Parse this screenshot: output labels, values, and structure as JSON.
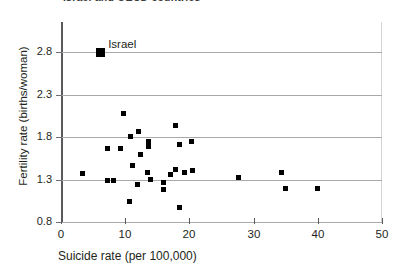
{
  "chart_data": {
    "type": "scatter",
    "title": "",
    "xlabel": "Suicide rate (per 100,000)",
    "ylabel": "Fertility rate (births/woman)",
    "xlim": [
      0,
      50
    ],
    "ylim": [
      0.8,
      2.8
    ],
    "xticks": [
      "0",
      "10",
      "20",
      "30",
      "40",
      "50"
    ],
    "yticks": [
      "0.8",
      "1.3",
      "1.8",
      "2.3",
      "2.8"
    ],
    "grid": "horizontal",
    "legend": "none",
    "annotations": [
      {
        "label": "Israel",
        "x": 6.1,
        "y": 2.79
      }
    ],
    "series": [
      {
        "name": "countries",
        "marker": "square",
        "color": "#000000",
        "points": [
          {
            "x": 6.1,
            "y": 2.79,
            "label": "Israel",
            "highlight": true
          },
          {
            "x": 3.3,
            "y": 1.37
          },
          {
            "x": 7.3,
            "y": 1.29
          },
          {
            "x": 7.2,
            "y": 1.67
          },
          {
            "x": 8.1,
            "y": 1.29
          },
          {
            "x": 9.2,
            "y": 1.67
          },
          {
            "x": 9.8,
            "y": 2.08
          },
          {
            "x": 10.9,
            "y": 1.81
          },
          {
            "x": 10.6,
            "y": 1.04
          },
          {
            "x": 11.1,
            "y": 1.47
          },
          {
            "x": 11.9,
            "y": 1.24
          },
          {
            "x": 12.0,
            "y": 1.87
          },
          {
            "x": 12.4,
            "y": 1.6
          },
          {
            "x": 13.5,
            "y": 1.38
          },
          {
            "x": 13.6,
            "y": 1.69
          },
          {
            "x": 13.7,
            "y": 1.75
          },
          {
            "x": 13.9,
            "y": 1.3
          },
          {
            "x": 15.9,
            "y": 1.18
          },
          {
            "x": 16.0,
            "y": 1.27
          },
          {
            "x": 17.1,
            "y": 1.36
          },
          {
            "x": 17.8,
            "y": 1.42
          },
          {
            "x": 17.8,
            "y": 1.93
          },
          {
            "x": 18.5,
            "y": 1.71
          },
          {
            "x": 19.3,
            "y": 1.38
          },
          {
            "x": 18.4,
            "y": 0.97
          },
          {
            "x": 20.4,
            "y": 1.75
          },
          {
            "x": 20.5,
            "y": 1.41
          },
          {
            "x": 27.7,
            "y": 1.32
          },
          {
            "x": 34.3,
            "y": 1.38
          },
          {
            "x": 34.9,
            "y": 1.2
          },
          {
            "x": 40.0,
            "y": 1.2
          }
        ]
      }
    ]
  },
  "axis": {
    "x_title": "Suicide rate (per 100,000)",
    "y_title": "Fertility rate (births/woman)"
  },
  "cropped_title": "Israel and OECD countries"
}
